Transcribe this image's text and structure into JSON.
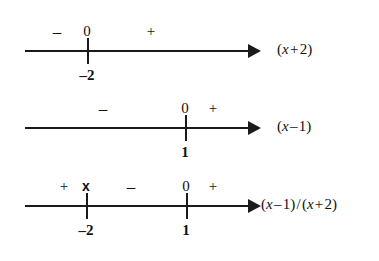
{
  "figure": {
    "type": "sign-analysis-number-lines",
    "background_color": "#ffffff",
    "ink_color": "#1a1a1a",
    "line_count": 3
  },
  "lines": [
    {
      "id": "line-x-plus-2",
      "expression": "(x + 2)",
      "expression_parts": {
        "open": "(",
        "var": "x",
        "op": " + ",
        "num": "2",
        "close": ")"
      },
      "axis": {
        "y": 50,
        "x_start": 25,
        "x_end": 248,
        "arrow_tip_x": 261
      },
      "ticks": [
        {
          "x": 87,
          "label_below": "–2",
          "label_above": "0"
        }
      ],
      "signs": [
        {
          "symbol": "–",
          "x": 57,
          "kind": "minus"
        },
        {
          "symbol": "0",
          "x": 87,
          "kind": "zero"
        },
        {
          "symbol": "+",
          "x": 151,
          "kind": "plus"
        }
      ],
      "label_x": 277
    },
    {
      "id": "line-x-minus-1",
      "expression": "(x – 1)",
      "expression_parts": {
        "open": "(",
        "var": "x",
        "op": " – ",
        "num": "1",
        "close": ")"
      },
      "axis": {
        "y": 127,
        "x_start": 25,
        "x_end": 248,
        "arrow_tip_x": 261
      },
      "ticks": [
        {
          "x": 185,
          "label_below": "1",
          "label_above": "0"
        }
      ],
      "signs": [
        {
          "symbol": "–",
          "x": 103,
          "kind": "minus"
        },
        {
          "symbol": "0",
          "x": 185,
          "kind": "zero"
        },
        {
          "symbol": "+",
          "x": 213,
          "kind": "plus"
        }
      ],
      "label_x": 277
    },
    {
      "id": "line-quotient",
      "expression": "(x – 1) / (x + 2)",
      "expression_parts": {
        "open": "(",
        "var": "x",
        "op": " – ",
        "num": "1",
        "close": ")"
      },
      "axis": {
        "y": 205,
        "x_start": 25,
        "x_end": 248,
        "arrow_tip_x": 261
      },
      "ticks": [
        {
          "x": 86,
          "label_below": "–2",
          "label_above": "x"
        },
        {
          "x": 186,
          "label_below": "1",
          "label_above": "0"
        }
      ],
      "signs": [
        {
          "symbol": "+",
          "x": 64,
          "kind": "plus"
        },
        {
          "symbol": "x",
          "x": 86,
          "kind": "xmark"
        },
        {
          "symbol": "–",
          "x": 131,
          "kind": "minus"
        },
        {
          "symbol": "0",
          "x": 186,
          "kind": "zero"
        },
        {
          "symbol": "+",
          "x": 213,
          "kind": "plus"
        }
      ],
      "label_x": 261
    }
  ],
  "expressions": {
    "first": {
      "open": "(",
      "var": "x",
      "op": "+",
      "num": "2",
      "close": ")"
    },
    "second": {
      "open": "(",
      "var": "x",
      "op": "–",
      "num": "1",
      "close": ")"
    },
    "third_numerator": {
      "open": "(",
      "var": "x",
      "op": "–",
      "num": "1",
      "close": ")"
    },
    "third_divider": "/",
    "third_denominator": {
      "open": "(",
      "var": "x",
      "op": "+",
      "num": "2",
      "close": ")"
    }
  }
}
